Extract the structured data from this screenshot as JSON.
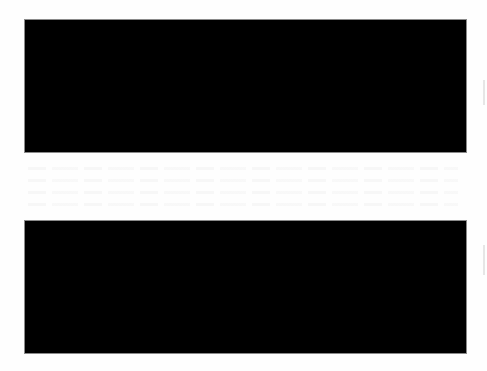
{
  "document": {
    "background_color": "#ffffff",
    "redactions": [
      {
        "id": "redaction-1",
        "color": "#000000",
        "x": 25,
        "y": 20,
        "width": 441,
        "height": 132
      },
      {
        "id": "redaction-2",
        "color": "#000000",
        "x": 25,
        "y": 221,
        "width": 441,
        "height": 132
      }
    ],
    "visible_text": []
  }
}
